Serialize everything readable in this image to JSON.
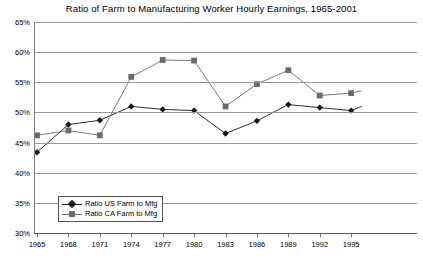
{
  "chart_data": {
    "type": "line",
    "title": "Ratio of Farm to Manufacturing Worker Hourly Earnings, 1965-2001",
    "xlabel": "",
    "ylabel": "",
    "ylim": [
      30,
      65
    ],
    "ytick_values": [
      65,
      60,
      55,
      50,
      45,
      40,
      35,
      30
    ],
    "ytick_labels": [
      "65%",
      "60%",
      "55%",
      "50%",
      "45%",
      "40%",
      "35%",
      "30%"
    ],
    "grid": true,
    "legend_position": "inside-lower-left",
    "x": [
      1965,
      1968,
      1971,
      1974,
      1977,
      1980,
      1983,
      1986,
      1989,
      1992,
      1995
    ],
    "xtick_labels": [
      "1965",
      "1968",
      "1971",
      "1974",
      "1977",
      "1980",
      "1983",
      "1986",
      "1989",
      "1992",
      "1995"
    ],
    "series": [
      {
        "name": "Ratio US Farm to Mfg",
        "marker": "diamond",
        "color": "#1a1a1a",
        "values": [
          43.4,
          48.0,
          48.7,
          51.0,
          50.5,
          50.3,
          46.5,
          48.6,
          51.3,
          50.8,
          50.3
        ]
      },
      {
        "name": "Ratio CA Farm to Mfg",
        "marker": "square",
        "color": "#6b6b6b",
        "values": [
          46.2,
          47.0,
          46.2,
          55.9,
          58.7,
          58.6,
          51.0,
          54.7,
          57.0,
          52.8,
          53.2
        ]
      }
    ],
    "extra_points": [
      {
        "series": "Ratio US Farm to Mfg",
        "x": 1996,
        "y": 51.0
      },
      {
        "series": "Ratio CA Farm to Mfg",
        "x": 1996,
        "y": 53.6
      }
    ]
  },
  "legend": {
    "items": [
      {
        "label": "Ratio US Farm to Mfg",
        "marker": "diamond"
      },
      {
        "label": "Ratio CA Farm to Mfg",
        "marker": "square"
      }
    ]
  }
}
